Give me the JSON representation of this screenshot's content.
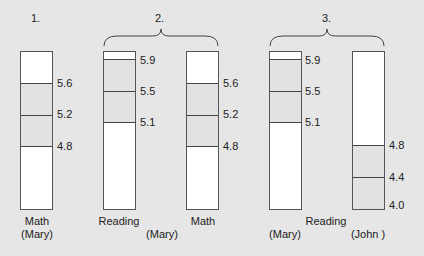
{
  "panels": [
    {
      "number": "1."
    },
    {
      "number": "2.",
      "shared_label": "(Mary)"
    },
    {
      "number": "3.",
      "shared_label": "Reading"
    }
  ],
  "bars": [
    {
      "panel": 1,
      "subject": "Math",
      "student": "(Mary)",
      "ticks": [
        "5.6",
        "5.2",
        "4.8"
      ]
    },
    {
      "panel": 2,
      "subject": "Reading",
      "ticks": [
        "5.9",
        "5.5",
        "5.1"
      ]
    },
    {
      "panel": 2,
      "subject": "Math",
      "ticks": [
        "5.6",
        "5.2",
        "4.8"
      ]
    },
    {
      "panel": 3,
      "student": "(Mary)",
      "ticks": [
        "5.9",
        "5.5",
        "5.1"
      ]
    },
    {
      "panel": 3,
      "student": "(John )",
      "ticks": [
        "4.8",
        "4.4",
        "4.0"
      ]
    }
  ],
  "colors": {
    "background": "#e6e6e6",
    "bar_fill": "#ffffff",
    "band_fill": "#e2e2e2",
    "line": "#444444"
  }
}
